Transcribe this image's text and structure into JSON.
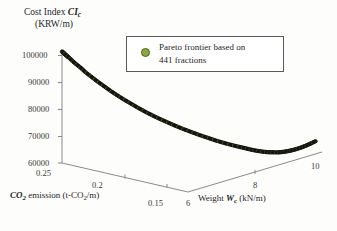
{
  "chart_data": {
    "type": "scatter",
    "title": "",
    "projection": "3d",
    "axes": {
      "y": {
        "label_line1_prefix": "Cost Index ",
        "label_line1_symbol": "CI",
        "label_line1_sub": "c",
        "label_line2": "(KRW/m)",
        "ticks": [
          60000,
          70000,
          80000,
          90000,
          100000
        ],
        "tick_labels": [
          "60000",
          "70000",
          "80000",
          "90000",
          "100000"
        ],
        "range": [
          60000,
          100000
        ],
        "unit": "KRW/m"
      },
      "depth": {
        "label_prefix": "CO",
        "label_sub": "2",
        "label_rest": " emission (t-CO",
        "label_rest_sub": "2",
        "label_tail": "/m)",
        "ticks": [
          0.25,
          0.2,
          0.15
        ],
        "tick_labels": [
          "0.25",
          "0.2",
          "0.15"
        ],
        "range": [
          0.15,
          0.25
        ],
        "unit": "t-CO2/m"
      },
      "x": {
        "label_prefix": "Weight ",
        "label_symbol": "W",
        "label_sub": "c",
        "label_tail": " (kN/m)",
        "ticks": [
          6,
          8,
          10
        ],
        "tick_labels": [
          "6",
          "8",
          "10"
        ],
        "range": [
          6,
          10
        ],
        "unit": "kN/m"
      }
    },
    "grid": false,
    "legend": {
      "position": "top-right-inside",
      "entries": [
        {
          "marker": "circle",
          "color": "#8aa83f",
          "edge_color": "#4e5e22",
          "label": "Pareto frontier based on\n441 fractions"
        }
      ]
    },
    "series": [
      {
        "name": "Pareto frontier based on 441 fractions",
        "point_count": 441,
        "marker_color": "#1c1c14",
        "marker_highlight": "#8a9a45",
        "description": "Dense Pareto front: cost index falls steeply with increasing weight and decreasing CO2, reaches a minimum near weight 8.6 kN/m, then rises slightly.",
        "weight_kN_per_m": [
          6.0,
          6.05,
          6.1,
          6.16,
          6.22,
          6.28,
          6.35,
          6.42,
          6.5,
          6.58,
          6.67,
          6.76,
          6.86,
          6.96,
          7.06,
          7.17,
          7.28,
          7.4,
          7.52,
          7.64,
          7.76,
          7.88,
          8.0,
          8.12,
          8.24,
          8.36,
          8.47,
          8.58,
          8.68,
          8.78,
          8.88,
          8.98,
          9.08,
          9.18,
          9.28,
          9.38,
          9.48,
          9.58,
          9.68,
          9.78,
          9.88,
          10.0
        ],
        "co2_t_per_m": [
          0.25,
          0.248,
          0.246,
          0.244,
          0.241,
          0.239,
          0.236,
          0.233,
          0.23,
          0.227,
          0.224,
          0.221,
          0.218,
          0.215,
          0.212,
          0.209,
          0.206,
          0.203,
          0.2,
          0.197,
          0.194,
          0.191,
          0.188,
          0.185,
          0.182,
          0.179,
          0.176,
          0.174,
          0.172,
          0.17,
          0.168,
          0.166,
          0.165,
          0.163,
          0.162,
          0.161,
          0.16,
          0.159,
          0.158,
          0.157,
          0.156,
          0.155
        ],
        "cost_index_KRW_per_m": [
          101500,
          100100,
          98800,
          97200,
          95600,
          94000,
          92300,
          90600,
          88900,
          87200,
          85500,
          83900,
          82300,
          80700,
          79200,
          77700,
          76300,
          74900,
          73500,
          72200,
          71000,
          69800,
          68700,
          67600,
          66600,
          65700,
          64900,
          64200,
          63500,
          62900,
          62400,
          62000,
          61700,
          61500,
          61400,
          61400,
          61500,
          61700,
          62000,
          62400,
          62900,
          63500
        ]
      }
    ]
  },
  "legend": {
    "text": "Pareto frontier based on\n441 fractions"
  },
  "yaxis": {
    "title_prefix": "Cost Index ",
    "title_symbol": "CI",
    "title_sub": "c",
    "title_units": "(KRW/m)",
    "t100000": "100000",
    "t90000": "90000",
    "t80000": "80000",
    "t70000": "70000",
    "t60000": "60000"
  },
  "depthaxis": {
    "title_co": "CO",
    "title_co_sub": "2",
    "title_mid": " emission (t-CO",
    "title_mid_sub": "2",
    "title_tail": "/m)",
    "t025": "0.25",
    "t02": "0.2",
    "t015": "0.15"
  },
  "xaxis": {
    "title_prefix": "Weight ",
    "title_symbol": "W",
    "title_sub": "c",
    "title_tail": " (kN/m)",
    "t6": "6",
    "t8": "8",
    "t10": "10"
  }
}
